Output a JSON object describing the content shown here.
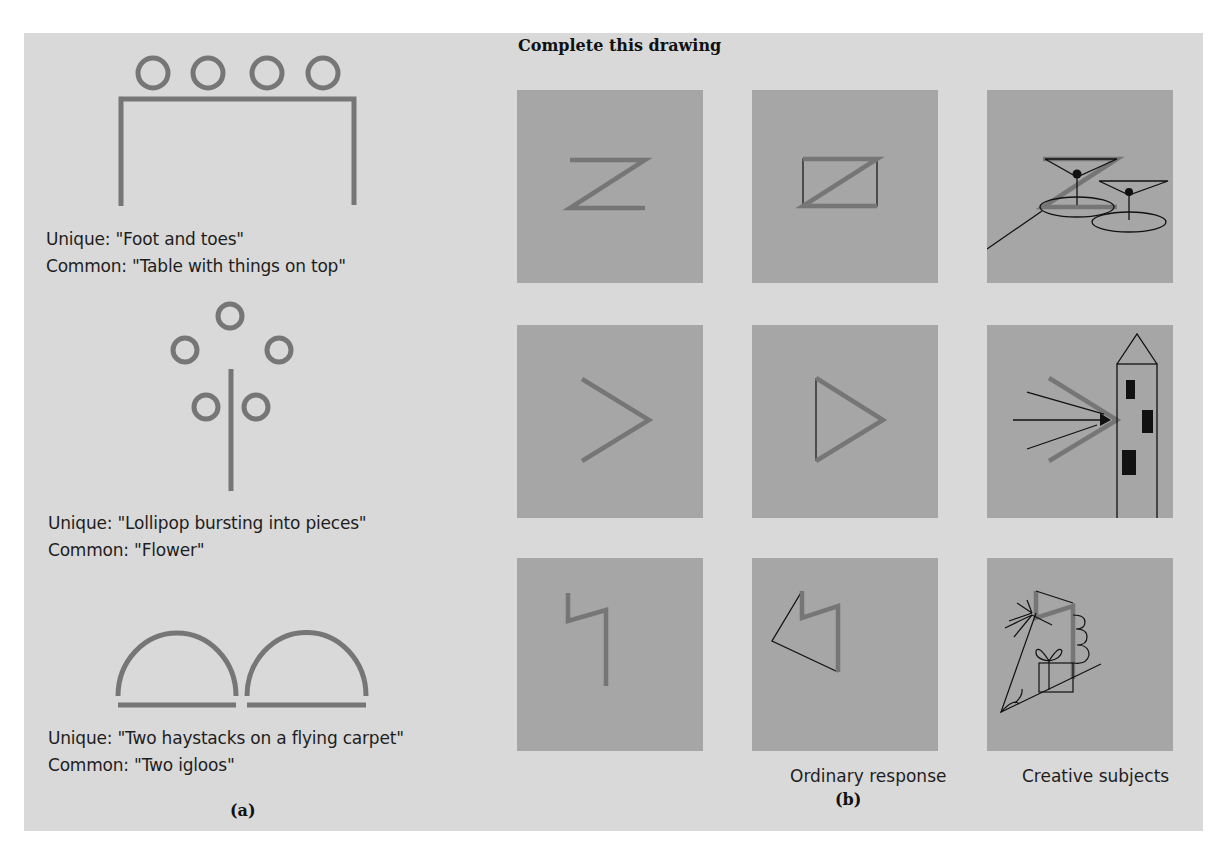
{
  "panel_a": {
    "label": "(a)",
    "figures": [
      {
        "name": "table-with-circles",
        "unique": "Unique: \"Foot and toes\"",
        "common": "Common: \"Table with things on top\""
      },
      {
        "name": "flower-circles",
        "unique": "Unique: \"Lollipop bursting into pieces\"",
        "common": "Common: \"Flower\""
      },
      {
        "name": "two-domes",
        "unique": "Unique: \"Two haystacks on a flying carpet\"",
        "common": "Common: \"Two igloos\""
      }
    ]
  },
  "panel_b": {
    "label": "(b)",
    "title": "Complete this drawing",
    "column_labels": [
      "",
      "Ordinary response",
      "Creative subjects"
    ],
    "rows": [
      {
        "stimulus": "Z shape",
        "ordinary": "Rectangle with diagonal",
        "creative": "Two martini glasses"
      },
      {
        "stimulus": "Angle bracket",
        "ordinary": "Triangle",
        "creative": "Tower with light beam"
      },
      {
        "stimulus": "Lightning step",
        "ordinary": "Pentagon outline",
        "creative": "Plant in box with sparkles"
      }
    ]
  },
  "colors": {
    "panel_bg": "#d9d9d9",
    "tile_bg": "#a6a6a6",
    "stimulus_stroke": "#767676",
    "response_stroke": "#111111"
  }
}
